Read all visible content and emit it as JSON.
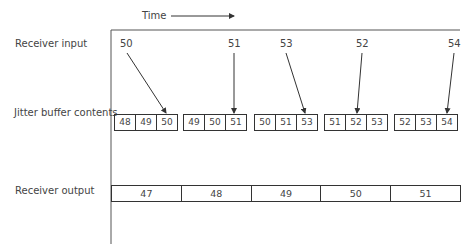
{
  "time_label": "Time",
  "rows": {
    "input_label": "Receiver input",
    "buffer_label": "Jitter buffer contents",
    "output_label": "Receiver output"
  },
  "receiver_input": [
    "50",
    "51",
    "53",
    "52",
    "54"
  ],
  "jitter_buffer": [
    [
      "48",
      "49",
      "50"
    ],
    [
      "49",
      "50",
      "51"
    ],
    [
      "50",
      "51",
      "53"
    ],
    [
      "51",
      "52",
      "53"
    ],
    [
      "52",
      "53",
      "54"
    ]
  ],
  "receiver_output": [
    "47",
    "48",
    "49",
    "50",
    "51"
  ],
  "colors": {
    "line": "#333333",
    "text": "#444444"
  }
}
